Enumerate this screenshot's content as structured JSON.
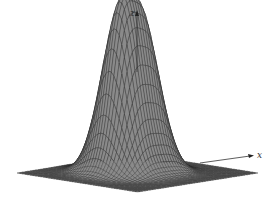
{
  "chart_data": {
    "type": "surface3d",
    "title": "",
    "axes": {
      "z_label": "z",
      "x_label": "x"
    },
    "peaks": [
      {
        "name": "left-peak",
        "x": -0.55,
        "y": 0.35,
        "height": 1.0
      },
      {
        "name": "right-peak",
        "x": 0.55,
        "y": 0.35,
        "height": 0.93
      }
    ],
    "grid": {
      "n": 46,
      "range": [
        -3,
        3
      ]
    },
    "style": {
      "fill": "#8a8a8a",
      "line": "#2a2a2a",
      "background": "#ffffff"
    }
  }
}
